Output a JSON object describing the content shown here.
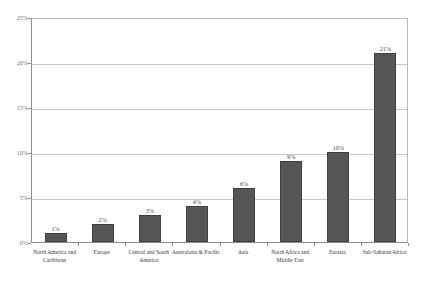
{
  "chart_data": {
    "type": "bar",
    "title": "",
    "subtitle": "",
    "xlabel": "",
    "ylabel": "",
    "ylim": [
      0,
      25
    ],
    "grid": true,
    "legend": false,
    "legend_position": "none",
    "bar_color": "#565656",
    "bar_border_color": "#3f3f3f",
    "gridline_color": "#c9c9c9",
    "axis_color": "#8d8d8d",
    "y_tick_labels": [
      "0%",
      "5%",
      "10%",
      "15%",
      "20%",
      "25%"
    ],
    "y_tick_values": [
      0,
      5,
      10,
      15,
      20,
      25
    ],
    "categories": [
      "North America and Caribbean",
      "Europe",
      "Central and South America",
      "Australasia & Pacific",
      "Asia",
      "North Africa and Middle East",
      "Eurasia",
      "Sub-Saharan Africa"
    ],
    "values": [
      1,
      2,
      3,
      4,
      6,
      9,
      10,
      21
    ],
    "data_labels": [
      "1%",
      "2%",
      "3%",
      "4%",
      "6%",
      "9%",
      "10%",
      "21%"
    ]
  }
}
